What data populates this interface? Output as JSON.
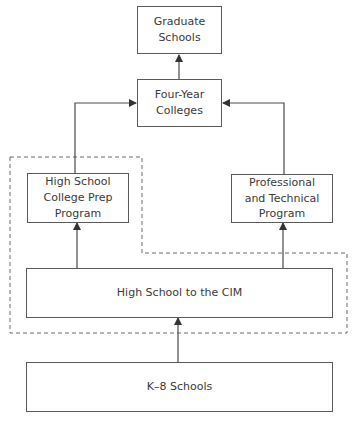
{
  "diagram": {
    "nodes": {
      "graduate": {
        "label": "Graduate\nSchools"
      },
      "four_year": {
        "label": "Four-Year\nColleges"
      },
      "college_prep": {
        "label": "High School\nCollege Prep\nProgram"
      },
      "professional": {
        "label": "Professional\nand Technical\nProgram"
      },
      "hs_cim": {
        "label": "High School to the CIM"
      },
      "k8": {
        "label": "K–8 Schools"
      }
    },
    "edges": [
      {
        "from": "four_year",
        "to": "graduate"
      },
      {
        "from": "college_prep",
        "to": "four_year"
      },
      {
        "from": "professional",
        "to": "four_year"
      },
      {
        "from": "hs_cim",
        "to": "college_prep"
      },
      {
        "from": "hs_cim",
        "to": "professional"
      },
      {
        "from": "k8",
        "to": "hs_cim"
      }
    ],
    "dashed_group": [
      "college_prep",
      "hs_cim",
      "professional"
    ],
    "colors": {
      "line": "#4a4a4a",
      "dash": "#6a6a6a",
      "text": "#3a3a3a"
    }
  }
}
